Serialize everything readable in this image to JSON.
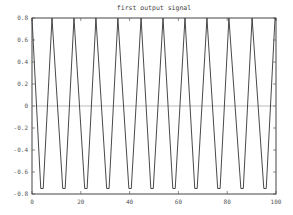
{
  "chart_data": {
    "type": "line",
    "title": "first output signal",
    "xlabel": "",
    "ylabel": "",
    "xlim": [
      0,
      100
    ],
    "ylim": [
      -0.8,
      0.8
    ],
    "grid": false,
    "legend": null,
    "x_ticks": [
      0,
      20,
      40,
      60,
      80,
      100
    ],
    "x_tick_labels": [
      "0",
      "20",
      "40",
      "60",
      "80",
      "100"
    ],
    "y_ticks": [
      0.8,
      0.6,
      0.4,
      0.2,
      0,
      -0.2,
      -0.4,
      -0.6,
      -0.8
    ],
    "y_tick_labels": [
      "0.8",
      "0.6",
      "0.4",
      "0.2",
      "0",
      "-0.2",
      "-0.4",
      "-0.6",
      "-0.8"
    ],
    "reference_line": {
      "y": 0,
      "color": "#aaaaaa"
    },
    "series": [
      {
        "name": "first output signal",
        "color": "#333333",
        "x": [
          0,
          3.6,
          4.6,
          8.2,
          8.2,
          12.6,
          13.6,
          17.2,
          17.2,
          21.6,
          22.6,
          26.2,
          26.2,
          30.6,
          31.6,
          35.2,
          35.2,
          39.7,
          40.7,
          44.7,
          44.7,
          48.7,
          49.7,
          53.7,
          53.7,
          57.7,
          58.7,
          62.7,
          62.7,
          66.7,
          67.7,
          71.7,
          71.7,
          76.1,
          77.1,
          80.7,
          80.7,
          85.6,
          86.6,
          90.2,
          90.2,
          95.0,
          96.0,
          99.6,
          100
        ],
        "y": [
          0.8,
          -0.75,
          -0.75,
          0.8,
          0.8,
          -0.75,
          -0.75,
          0.8,
          0.8,
          -0.75,
          -0.75,
          0.8,
          0.8,
          -0.75,
          -0.75,
          0.8,
          0.8,
          -0.75,
          -0.75,
          0.8,
          0.8,
          -0.75,
          -0.75,
          0.8,
          0.8,
          -0.75,
          -0.75,
          0.8,
          0.8,
          -0.75,
          -0.75,
          0.8,
          0.8,
          -0.75,
          -0.75,
          0.8,
          0.8,
          -0.75,
          -0.75,
          0.8,
          0.8,
          -0.75,
          -0.75,
          0.8,
          0.78
        ]
      }
    ]
  },
  "plot_area": {
    "left": 32,
    "top": 18,
    "right": 276,
    "bottom": 194
  },
  "colors": {
    "axis": "#444444",
    "signal": "#333333",
    "zero_line": "#aaaaaa",
    "text": "#555555"
  }
}
